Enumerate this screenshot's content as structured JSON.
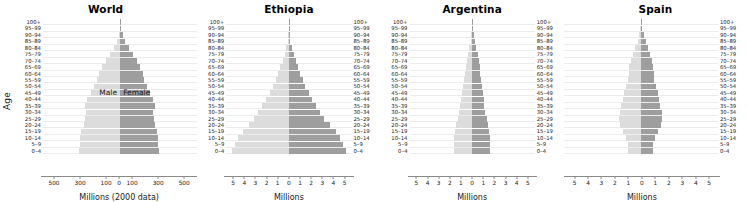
{
  "figure": {
    "y_axis_label": "Age",
    "male_color": "#dcdcdc",
    "female_color": "#9e9e9e",
    "age_groups": [
      "100+",
      "95–99",
      "90–94",
      "85–89",
      "80–84",
      "75–79",
      "70–74",
      "65–69",
      "60–64",
      "55–59",
      "50–54",
      "45–49",
      "40–44",
      "35–39",
      "30–34",
      "25–29",
      "20–24",
      "15–19",
      "10–14",
      "5–9",
      "0–4"
    ]
  },
  "chart_data": [
    {
      "type": "bar",
      "title": "World",
      "xlabel": "Millions (2000 data)",
      "ylabel": "Age",
      "grid": true,
      "legend_position": "in-plot",
      "male_label": "Male",
      "female_label": "Female",
      "xlim": [
        -600,
        600
      ],
      "xticks": [
        -500,
        -300,
        -100,
        0,
        100,
        300,
        500
      ],
      "xticklabels": [
        "500",
        "300",
        "100",
        "0",
        "100",
        "300",
        "500"
      ],
      "categories": [
        "100+",
        "95–99",
        "90–94",
        "85–89",
        "80–84",
        "75–79",
        "70–74",
        "65–69",
        "60–64",
        "55–59",
        "50–54",
        "45–49",
        "40–44",
        "35–39",
        "30–34",
        "25–29",
        "20–24",
        "15–19",
        "10–14",
        "5–9",
        "0–4"
      ],
      "series": [
        {
          "name": "Male",
          "values": [
            1,
            4,
            11,
            25,
            47,
            76,
            110,
            143,
            166,
            182,
            203,
            228,
            255,
            277,
            264,
            270,
            281,
            303,
            311,
            313,
            322
          ]
        },
        {
          "name": "Female",
          "values": [
            2,
            8,
            19,
            38,
            66,
            97,
            130,
            158,
            176,
            188,
            206,
            229,
            253,
            272,
            257,
            261,
            270,
            288,
            295,
            296,
            303
          ]
        }
      ]
    },
    {
      "type": "bar",
      "title": "Ethiopia",
      "xlabel": "Millions",
      "grid": true,
      "xlim": [
        -5.8,
        5.8
      ],
      "xticks": [
        -5,
        -4,
        -3,
        -2,
        -1,
        0,
        1,
        2,
        3,
        4,
        5
      ],
      "xticklabels": [
        "5",
        "4",
        "3",
        "2",
        "1",
        "0",
        "1",
        "2",
        "3",
        "4",
        "5"
      ],
      "categories": [
        "100+",
        "95–99",
        "90–94",
        "85–89",
        "80–84",
        "75–79",
        "70–74",
        "65–69",
        "60–64",
        "55–59",
        "50–54",
        "45–49",
        "40–44",
        "35–39",
        "30–34",
        "25–29",
        "20–24",
        "15–19",
        "10–14",
        "5–9",
        "0–4"
      ],
      "series": [
        {
          "name": "Male",
          "values": [
            0.01,
            0.02,
            0.05,
            0.12,
            0.24,
            0.4,
            0.58,
            0.78,
            1.0,
            1.22,
            1.48,
            1.78,
            2.1,
            2.45,
            2.82,
            3.22,
            3.7,
            4.25,
            4.7,
            4.95,
            5.25
          ]
        },
        {
          "name": "Female",
          "values": [
            0.01,
            0.03,
            0.07,
            0.15,
            0.28,
            0.45,
            0.63,
            0.83,
            1.05,
            1.27,
            1.53,
            1.83,
            2.15,
            2.5,
            2.88,
            3.28,
            3.78,
            4.32,
            4.75,
            5.0,
            5.3
          ]
        }
      ]
    },
    {
      "type": "bar",
      "title": "Argentina",
      "xlabel": "Millions",
      "grid": true,
      "xlim": [
        -5.8,
        5.8
      ],
      "xticks": [
        -5,
        -4,
        -3,
        -2,
        -1,
        0,
        1,
        2,
        3,
        4,
        5
      ],
      "xticklabels": [
        "5",
        "4",
        "3",
        "2",
        "1",
        "0",
        "1",
        "2",
        "3",
        "4",
        "5"
      ],
      "categories": [
        "100+",
        "95–99",
        "90–94",
        "85–89",
        "80–84",
        "75–79",
        "70–74",
        "65–69",
        "60–64",
        "55–59",
        "50–54",
        "45–49",
        "40–44",
        "35–39",
        "30–34",
        "25–29",
        "20–24",
        "15–19",
        "10–14",
        "5–9",
        "0–4"
      ],
      "series": [
        {
          "name": "Male",
          "values": [
            0.01,
            0.03,
            0.07,
            0.14,
            0.25,
            0.37,
            0.48,
            0.57,
            0.66,
            0.76,
            0.85,
            0.93,
            1.02,
            1.1,
            1.2,
            1.34,
            1.5,
            1.62,
            1.68,
            1.7,
            1.7
          ]
        },
        {
          "name": "Female",
          "values": [
            0.02,
            0.06,
            0.13,
            0.23,
            0.37,
            0.51,
            0.62,
            0.7,
            0.77,
            0.85,
            0.92,
            0.99,
            1.06,
            1.13,
            1.22,
            1.34,
            1.48,
            1.58,
            1.63,
            1.64,
            1.63
          ]
        }
      ]
    },
    {
      "type": "bar",
      "title": "Spain",
      "xlabel": "Millions",
      "grid": true,
      "xlim": [
        -5.8,
        5.8
      ],
      "xticks": [
        -5,
        -4,
        -3,
        -2,
        -1,
        0,
        1,
        2,
        3,
        4,
        5
      ],
      "xticklabels": [
        "5",
        "4",
        "3",
        "2",
        "1",
        "0",
        "1",
        "2",
        "3",
        "4",
        "5"
      ],
      "categories": [
        "100+",
        "95–99",
        "90–94",
        "85–89",
        "80–84",
        "75–79",
        "70–74",
        "65–69",
        "60–64",
        "55–59",
        "50–54",
        "45–49",
        "40–44",
        "35–39",
        "30–34",
        "25–29",
        "20–24",
        "15–19",
        "10–14",
        "5–9",
        "0–4"
      ],
      "series": [
        {
          "name": "Male",
          "values": [
            0.01,
            0.04,
            0.11,
            0.24,
            0.41,
            0.58,
            0.72,
            0.86,
            0.92,
            0.98,
            1.12,
            1.25,
            1.36,
            1.5,
            1.6,
            1.62,
            1.55,
            1.38,
            1.12,
            0.98,
            0.99
          ]
        },
        {
          "name": "Female",
          "values": [
            0.03,
            0.1,
            0.22,
            0.38,
            0.56,
            0.72,
            0.83,
            0.93,
            0.97,
            1.02,
            1.14,
            1.26,
            1.35,
            1.47,
            1.57,
            1.59,
            1.5,
            1.32,
            1.06,
            0.93,
            0.93
          ]
        }
      ]
    }
  ]
}
